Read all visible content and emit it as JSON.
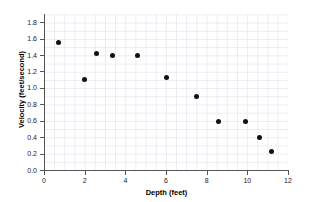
{
  "chart_data": {
    "type": "scatter",
    "title": "",
    "xlabel": "Depth (feet)",
    "ylabel": "Velocity (feet/second)",
    "xlim": [
      0,
      12
    ],
    "ylim": [
      0.0,
      1.9
    ],
    "grid": true,
    "legend": null,
    "xticks": [
      "0",
      "2",
      "4",
      "6",
      "8",
      "10",
      "12"
    ],
    "xtick_values": [
      0,
      2,
      4,
      6,
      8,
      10,
      12
    ],
    "yticks": [
      "0.0",
      "0.2",
      "0.4",
      "0.6",
      "0.8",
      "1.0",
      "1.2",
      "1.4",
      "1.6",
      "1.8"
    ],
    "ytick_values": [
      0.0,
      0.2,
      0.4,
      0.6,
      0.8,
      1.0,
      1.2,
      1.4,
      1.6,
      1.8
    ],
    "marker_color": "#111111",
    "grid_color": "#eceaf2",
    "axis_color": "#555555",
    "points": [
      {
        "x": 0.7,
        "y": 1.55
      },
      {
        "x": 2.0,
        "y": 1.1
      },
      {
        "x": 2.6,
        "y": 1.42
      },
      {
        "x": 3.35,
        "y": 1.39
      },
      {
        "x": 4.6,
        "y": 1.39
      },
      {
        "x": 6.0,
        "y": 1.13
      },
      {
        "x": 7.5,
        "y": 0.89
      },
      {
        "x": 8.6,
        "y": 0.59
      },
      {
        "x": 9.9,
        "y": 0.59
      },
      {
        "x": 10.6,
        "y": 0.4
      },
      {
        "x": 11.2,
        "y": 0.22
      }
    ]
  }
}
